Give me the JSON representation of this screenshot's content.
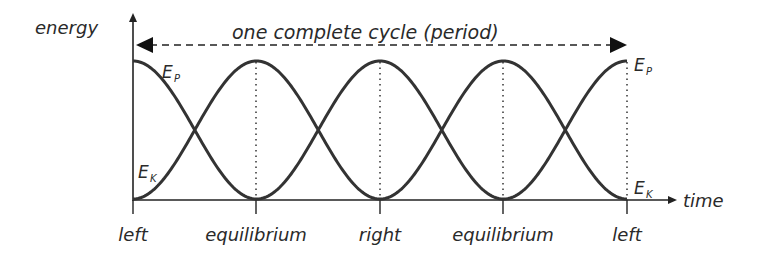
{
  "chart_data": {
    "type": "line",
    "title": "one complete cycle (period)",
    "ylabel": "energy",
    "xlabel": "time",
    "x_tick_labels": [
      "left",
      "equilibrium",
      "right",
      "equilibrium",
      "left"
    ],
    "x": [
      0,
      0.25,
      0.5,
      0.75,
      1.0
    ],
    "series": [
      {
        "name": "E_P",
        "label_main": "E",
        "label_sub": "P",
        "values": [
          1,
          0,
          1,
          0,
          1
        ]
      },
      {
        "name": "E_K",
        "label_main": "E",
        "label_sub": "K",
        "values": [
          0,
          1,
          0,
          1,
          0
        ]
      }
    ],
    "ylim": [
      0,
      1
    ],
    "grid": false,
    "annotations": [
      "double-headed dashed arrow spanning one complete cycle (period)",
      "dotted vertical lines at each tick"
    ]
  },
  "labels": {
    "energy": "energy",
    "time": "time",
    "period": "one complete cycle (period)",
    "tick0": "left",
    "tick1": "equilibrium",
    "tick2": "right",
    "tick3": "equilibrium",
    "tick4": "left",
    "ep_main": "E",
    "ep_sub": "P",
    "ek_main": "E",
    "ek_sub": "K"
  },
  "colors": {
    "curve": "#333333",
    "axis": "#222222",
    "text": "#2a2a2a"
  }
}
